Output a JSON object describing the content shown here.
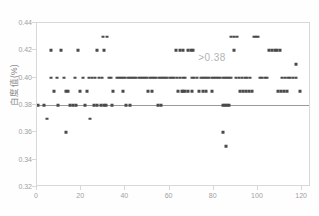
{
  "chart_data": {
    "type": "scatter",
    "title": "",
    "xlabel": "",
    "ylabel": "白度值(%)",
    "xlim": [
      0,
      124
    ],
    "ylim": [
      0.32,
      0.44
    ],
    "xticks": [
      0,
      20,
      40,
      60,
      80,
      100,
      120
    ],
    "yticks": [
      0.44,
      0.42,
      0.4,
      0.38,
      0.36,
      0.34,
      0.32
    ],
    "ytick_labels": [
      "0.44",
      "0.42",
      "0.40",
      "0.38",
      "0.36",
      "0.34",
      "0.32"
    ],
    "xtick_labels": [
      "0",
      "20",
      "40",
      "60",
      "80",
      "100",
      "120"
    ],
    "grid": false,
    "legend": "none",
    "reference_line": {
      "y": 0.38,
      "color": "#9a9a9a",
      "label": ">0.38"
    },
    "annotations": [
      {
        "text": ">0.38",
        "x": 73,
        "y": 0.414,
        "color": "#b4b4b4"
      }
    ],
    "points": [
      {
        "x": 3.0,
        "y": 0.38
      },
      {
        "x": 4.6,
        "y": 0.37
      },
      {
        "x": 6.4,
        "y": 0.42
      },
      {
        "x": 6.4,
        "y": 0.4
      },
      {
        "x": 7.6,
        "y": 0.39
      },
      {
        "x": 9.0,
        "y": 0.4
      },
      {
        "x": 9.6,
        "y": 0.38
      },
      {
        "x": 11.0,
        "y": 0.42
      },
      {
        "x": 12.4,
        "y": 0.4
      },
      {
        "x": 13.0,
        "y": 0.39
      },
      {
        "x": 14.2,
        "y": 0.39
      },
      {
        "x": 15.0,
        "y": 0.38
      },
      {
        "x": 16.2,
        "y": 0.38
      },
      {
        "x": 17.0,
        "y": 0.4
      },
      {
        "x": 17.8,
        "y": 0.38
      },
      {
        "x": 18.6,
        "y": 0.42
      },
      {
        "x": 19.4,
        "y": 0.39
      },
      {
        "x": 20.6,
        "y": 0.4
      },
      {
        "x": 21.8,
        "y": 0.38
      },
      {
        "x": 22.6,
        "y": 0.39
      },
      {
        "x": 23.6,
        "y": 0.4
      },
      {
        "x": 25.0,
        "y": 0.4
      },
      {
        "x": 26.2,
        "y": 0.4
      },
      {
        "x": 27.0,
        "y": 0.42
      },
      {
        "x": 28.2,
        "y": 0.4
      },
      {
        "x": 29.4,
        "y": 0.4
      },
      {
        "x": 30.4,
        "y": 0.42
      },
      {
        "x": 31.6,
        "y": 0.43
      },
      {
        "x": 32.4,
        "y": 0.4
      },
      {
        "x": 33.6,
        "y": 0.4
      },
      {
        "x": 34.6,
        "y": 0.39
      },
      {
        "x": 36.0,
        "y": 0.4
      },
      {
        "x": 37.0,
        "y": 0.4
      },
      {
        "x": 38.0,
        "y": 0.4
      },
      {
        "x": 39.0,
        "y": 0.4
      },
      {
        "x": 40.0,
        "y": 0.4
      },
      {
        "x": 41.0,
        "y": 0.4
      },
      {
        "x": 42.0,
        "y": 0.4
      },
      {
        "x": 43.0,
        "y": 0.4
      },
      {
        "x": 44.0,
        "y": 0.4
      },
      {
        "x": 45.0,
        "y": 0.4
      },
      {
        "x": 46.0,
        "y": 0.4
      },
      {
        "x": 47.0,
        "y": 0.4
      },
      {
        "x": 48.0,
        "y": 0.4
      },
      {
        "x": 49.0,
        "y": 0.4
      },
      {
        "x": 50.0,
        "y": 0.4
      },
      {
        "x": 51.0,
        "y": 0.4
      },
      {
        "x": 52.0,
        "y": 0.4
      },
      {
        "x": 53.0,
        "y": 0.4
      },
      {
        "x": 54.0,
        "y": 0.4
      },
      {
        "x": 55.0,
        "y": 0.4
      },
      {
        "x": 56.0,
        "y": 0.4
      },
      {
        "x": 57.0,
        "y": 0.4
      },
      {
        "x": 58.0,
        "y": 0.4
      },
      {
        "x": 59.0,
        "y": 0.4
      },
      {
        "x": 60.0,
        "y": 0.4
      },
      {
        "x": 61.0,
        "y": 0.4
      },
      {
        "x": 62.0,
        "y": 0.4
      },
      {
        "x": 29.0,
        "y": 0.38
      },
      {
        "x": 30.2,
        "y": 0.38
      },
      {
        "x": 31.2,
        "y": 0.38
      },
      {
        "x": 34.0,
        "y": 0.38
      },
      {
        "x": 39.0,
        "y": 0.39
      },
      {
        "x": 40.2,
        "y": 0.38
      },
      {
        "x": 42.0,
        "y": 0.38
      },
      {
        "x": 24.0,
        "y": 0.37
      },
      {
        "x": 26.0,
        "y": 0.38
      },
      {
        "x": 27.0,
        "y": 0.38
      },
      {
        "x": 50.4,
        "y": 0.39
      },
      {
        "x": 52.0,
        "y": 0.39
      },
      {
        "x": 54.6,
        "y": 0.38
      },
      {
        "x": 56.0,
        "y": 0.38
      },
      {
        "x": 63.0,
        "y": 0.42
      },
      {
        "x": 64.6,
        "y": 0.42
      },
      {
        "x": 66.0,
        "y": 0.42
      },
      {
        "x": 68.4,
        "y": 0.42
      },
      {
        "x": 69.6,
        "y": 0.42
      },
      {
        "x": 70.8,
        "y": 0.42
      },
      {
        "x": 63.4,
        "y": 0.4
      },
      {
        "x": 64.8,
        "y": 0.4
      },
      {
        "x": 66.0,
        "y": 0.4
      },
      {
        "x": 67.0,
        "y": 0.4
      },
      {
        "x": 66.0,
        "y": 0.39
      },
      {
        "x": 70.0,
        "y": 0.4
      },
      {
        "x": 71.2,
        "y": 0.4
      },
      {
        "x": 72.6,
        "y": 0.4
      },
      {
        "x": 74.0,
        "y": 0.4
      },
      {
        "x": 75.0,
        "y": 0.4
      },
      {
        "x": 76.0,
        "y": 0.4
      },
      {
        "x": 77.0,
        "y": 0.4
      },
      {
        "x": 78.0,
        "y": 0.4
      },
      {
        "x": 79.0,
        "y": 0.4
      },
      {
        "x": 80.0,
        "y": 0.4
      },
      {
        "x": 81.0,
        "y": 0.4
      },
      {
        "x": 82.0,
        "y": 0.4
      },
      {
        "x": 83.0,
        "y": 0.4
      },
      {
        "x": 84.0,
        "y": 0.4
      },
      {
        "x": 85.0,
        "y": 0.4
      },
      {
        "x": 86.0,
        "y": 0.4
      },
      {
        "x": 87.0,
        "y": 0.4
      },
      {
        "x": 88.0,
        "y": 0.4
      },
      {
        "x": 64.0,
        "y": 0.39
      },
      {
        "x": 65.4,
        "y": 0.39
      },
      {
        "x": 67.0,
        "y": 0.39
      },
      {
        "x": 68.4,
        "y": 0.39
      },
      {
        "x": 70.0,
        "y": 0.39
      },
      {
        "x": 73.4,
        "y": 0.39
      },
      {
        "x": 75.0,
        "y": 0.39
      },
      {
        "x": 76.4,
        "y": 0.39
      },
      {
        "x": 79.4,
        "y": 0.39
      },
      {
        "x": 89.0,
        "y": 0.42
      },
      {
        "x": 90.0,
        "y": 0.4
      },
      {
        "x": 91.4,
        "y": 0.4
      },
      {
        "x": 92.6,
        "y": 0.4
      },
      {
        "x": 94.0,
        "y": 0.4
      },
      {
        "x": 95.2,
        "y": 0.4
      },
      {
        "x": 96.4,
        "y": 0.4
      },
      {
        "x": 92.0,
        "y": 0.39
      },
      {
        "x": 93.4,
        "y": 0.39
      },
      {
        "x": 94.6,
        "y": 0.39
      },
      {
        "x": 96.0,
        "y": 0.39
      },
      {
        "x": 97.2,
        "y": 0.39
      },
      {
        "x": 98.0,
        "y": 0.43
      },
      {
        "x": 99.0,
        "y": 0.43
      },
      {
        "x": 100.0,
        "y": 0.43
      },
      {
        "x": 101.0,
        "y": 0.4
      },
      {
        "x": 102.0,
        "y": 0.4
      },
      {
        "x": 103.0,
        "y": 0.4
      },
      {
        "x": 104.0,
        "y": 0.4
      },
      {
        "x": 105.0,
        "y": 0.42
      },
      {
        "x": 106.4,
        "y": 0.42
      },
      {
        "x": 107.6,
        "y": 0.42
      },
      {
        "x": 108.8,
        "y": 0.42
      },
      {
        "x": 110.0,
        "y": 0.42
      },
      {
        "x": 111.0,
        "y": 0.4
      },
      {
        "x": 112.2,
        "y": 0.4
      },
      {
        "x": 113.4,
        "y": 0.4
      },
      {
        "x": 114.6,
        "y": 0.4
      },
      {
        "x": 116.0,
        "y": 0.4
      },
      {
        "x": 117.4,
        "y": 0.4
      },
      {
        "x": 119.0,
        "y": 0.39
      },
      {
        "x": 109.0,
        "y": 0.39
      },
      {
        "x": 110.4,
        "y": 0.39
      },
      {
        "x": 111.6,
        "y": 0.39
      },
      {
        "x": 113.0,
        "y": 0.39
      },
      {
        "x": 117.0,
        "y": 0.41
      },
      {
        "x": 88.0,
        "y": 0.43
      },
      {
        "x": 89.2,
        "y": 0.43
      },
      {
        "x": 90.4,
        "y": 0.43
      },
      {
        "x": 13.0,
        "y": 0.36
      },
      {
        "x": 84.0,
        "y": 0.36
      },
      {
        "x": 0.6,
        "y": 0.38
      },
      {
        "x": 84.0,
        "y": 0.38
      },
      {
        "x": 85.0,
        "y": 0.38
      },
      {
        "x": 86.0,
        "y": 0.38
      },
      {
        "x": 87.0,
        "y": 0.38
      },
      {
        "x": 85.6,
        "y": 0.35
      },
      {
        "x": 30.0,
        "y": 0.43
      }
    ]
  }
}
